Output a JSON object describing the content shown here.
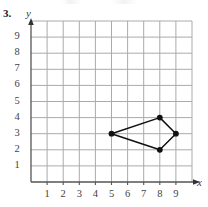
{
  "problem": {
    "number": "3."
  },
  "chart_data": {
    "type": "scatter",
    "title": "",
    "xlabel": "x",
    "ylabel": "y",
    "xlim": [
      0,
      10
    ],
    "ylim": [
      0,
      10
    ],
    "grid": true,
    "legend": null,
    "xticks": [
      1,
      2,
      3,
      4,
      5,
      6,
      7,
      8,
      9
    ],
    "yticks": [
      1,
      2,
      3,
      4,
      5,
      6,
      7,
      8,
      9
    ],
    "xtick_labels": [
      "1",
      "2",
      "3",
      "4",
      "5",
      "6",
      "7",
      "8",
      "9"
    ],
    "ytick_labels": [
      "1",
      "2",
      "3",
      "4",
      "5",
      "6",
      "7",
      "8",
      "9"
    ],
    "shape": {
      "name": "quadrilateral",
      "closed": true,
      "vertices": [
        {
          "x": 5,
          "y": 3
        },
        {
          "x": 8,
          "y": 4
        },
        {
          "x": 9,
          "y": 3
        },
        {
          "x": 8,
          "y": 2
        }
      ],
      "point_color": "#111111",
      "line_color": "#111111"
    },
    "colors": {
      "grid": "#aaaaaa",
      "axis": "#555555",
      "ink": "#111111"
    }
  }
}
